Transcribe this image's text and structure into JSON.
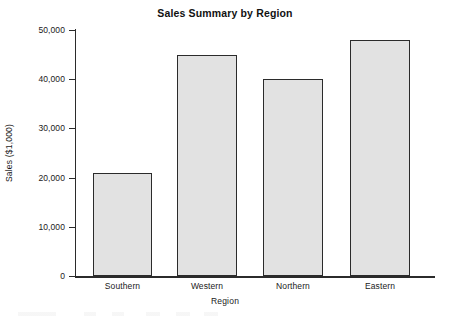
{
  "chart_data": {
    "type": "bar",
    "title": "Sales Summary by Region",
    "xlabel": "Region",
    "ylabel": "Sales ($1,000)",
    "categories": [
      "Southern",
      "Western",
      "Northern",
      "Eastern"
    ],
    "values": [
      21000,
      45000,
      40000,
      48000
    ],
    "ylim": [
      0,
      50000
    ],
    "yticks": [
      0,
      10000,
      20000,
      30000,
      40000,
      50000
    ],
    "ytick_labels": [
      "0",
      "10,000",
      "20,000",
      "30,000",
      "40,000",
      "50,000"
    ],
    "grid": false,
    "legend": null,
    "bar_fill_color": "#e2e2e2",
    "bar_border_color": "#2b2b2b",
    "axis_color": "#2b2b2b",
    "background_color": "#ffffff"
  }
}
